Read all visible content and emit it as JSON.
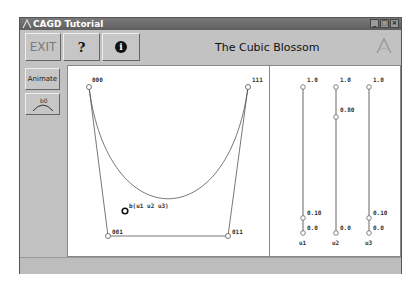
{
  "window": {
    "title": "CAGD Tutorial",
    "controls": [
      "minimize",
      "maximize",
      "close"
    ]
  },
  "toolbar": {
    "exit_label": "EXIT",
    "help_label": "?",
    "info_label": "i",
    "app_title": "The Cubic Blossom"
  },
  "sidebar": {
    "animate_label": "Animate",
    "bezier_label": "b0"
  },
  "canvas": {
    "control_points": [
      {
        "label": "000",
        "x": 20,
        "y": 20
      },
      {
        "label": "001",
        "x": 40,
        "y": 170
      },
      {
        "label": "011",
        "x": 160,
        "y": 170
      },
      {
        "label": "111",
        "x": 180,
        "y": 20
      }
    ],
    "blossom_point": {
      "label": "b(u1 u2 u3)"
    }
  },
  "sliders": [
    {
      "name": "u1",
      "top_label": "1.0",
      "bottom_label": "0.0",
      "value_label": "0.10"
    },
    {
      "name": "u2",
      "top_label": "1.0",
      "bottom_label": "0.0",
      "value_label": "0.80"
    },
    {
      "name": "u3",
      "top_label": "1.0",
      "bottom_label": "0.0",
      "value_label": "0.10"
    }
  ],
  "colors": {
    "window_bg": "#c2c2c2",
    "titlebar": "#6a6a6a",
    "canvas_bg": "#ffffff",
    "curve": "#555555"
  }
}
